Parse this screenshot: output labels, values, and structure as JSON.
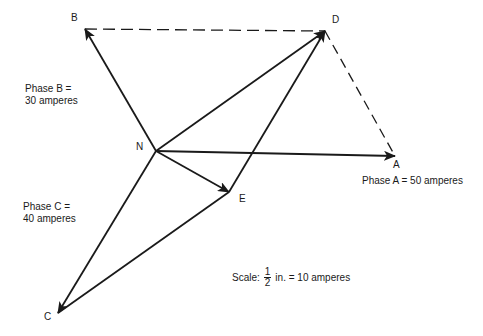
{
  "diagram": {
    "type": "phasor-diagram",
    "points": {
      "N": {
        "label": "N",
        "x": 156,
        "y": 151
      },
      "A": {
        "label": "A",
        "x": 395,
        "y": 156
      },
      "B": {
        "label": "B",
        "x": 85,
        "y": 29
      },
      "C": {
        "label": "C",
        "x": 58,
        "y": 313
      },
      "D": {
        "label": "D",
        "x": 325,
        "y": 31
      },
      "E": {
        "label": "E",
        "x": 229,
        "y": 192
      }
    },
    "vectors": [
      {
        "from": "N",
        "to": "A",
        "style": "solid-arrow"
      },
      {
        "from": "N",
        "to": "B",
        "style": "solid-arrow"
      },
      {
        "from": "N",
        "to": "C",
        "style": "solid-arrow"
      },
      {
        "from": "N",
        "to": "D",
        "style": "solid-arrow"
      },
      {
        "from": "N",
        "to": "E",
        "style": "solid-arrow"
      },
      {
        "from": "C",
        "to": "E",
        "style": "solid-line"
      },
      {
        "from": "E",
        "to": "D",
        "style": "solid-arrow"
      },
      {
        "from": "B",
        "to": "D",
        "style": "dashed"
      },
      {
        "from": "D",
        "to": "A",
        "style": "dashed"
      }
    ],
    "phase_labels": {
      "phase_a": "Phase A = 50 amperes",
      "phase_b_line1": "Phase B =",
      "phase_b_line2": "30 amperes",
      "phase_c_line1": "Phase C =",
      "phase_c_line2": "40 amperes"
    },
    "scale": {
      "prefix": "Scale:",
      "numerator": "1",
      "denominator": "2",
      "suffix": "in. = 10 amperes"
    },
    "colors": {
      "ink": "#1a1a1a",
      "background": "#ffffff"
    }
  }
}
